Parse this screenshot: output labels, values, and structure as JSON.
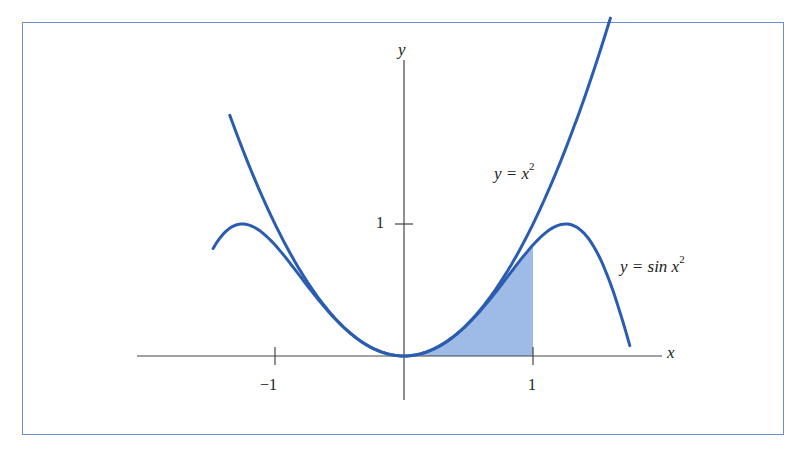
{
  "chart_data": {
    "type": "line",
    "title": "",
    "xlabel": "x",
    "ylabel": "y",
    "xlim": [
      -2.1,
      2.0
    ],
    "ylim": [
      -0.6,
      2.3
    ],
    "grid": false,
    "xticks": [
      -1,
      1
    ],
    "xtick_labels": [
      "−1",
      "1"
    ],
    "yticks": [
      1
    ],
    "ytick_labels": [
      "1"
    ],
    "series": [
      {
        "name": "y = x^2",
        "label_main": "y = x",
        "label_sup": "2",
        "function": "x^2",
        "domain": [
          -1.35,
          1.6
        ],
        "color": "#2a5db0"
      },
      {
        "name": "y = sin x^2",
        "label_main": "y = sin x",
        "label_sup": "2",
        "function": "sin(x^2)",
        "domain": [
          -1.48,
          1.75
        ],
        "color": "#2a5db0"
      }
    ],
    "shaded_region": {
      "under": "sin(x^2)",
      "from": 0,
      "to": 1,
      "color": "#9dbbe6"
    },
    "legend": "inline labels"
  },
  "colors": {
    "frame": "#6a8fcf",
    "curve": "#2a5db0",
    "axis": "#444444",
    "fill": "#9dbbe6"
  }
}
